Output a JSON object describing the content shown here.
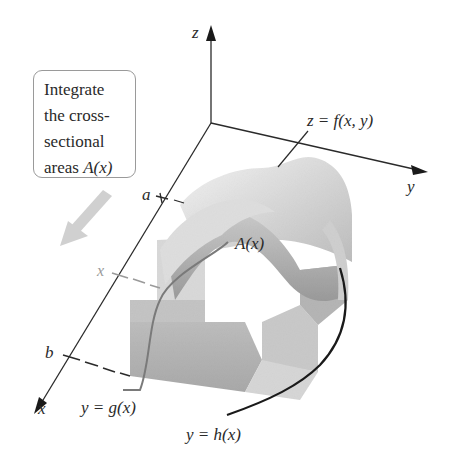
{
  "diagram": {
    "callout": {
      "lines": [
        "Integrate",
        "the cross-",
        "sectional",
        "areas "
      ],
      "last_line_math": "A(x)"
    },
    "axes": {
      "x_label": "x",
      "y_label": "y",
      "z_label": "z"
    },
    "ticks": {
      "a_label": "a",
      "x_label": "x",
      "b_label": "b"
    },
    "surface_label": "z = f(x, y)",
    "cross_section_label": "A(x)",
    "lower_curve_label": "y = g(x)",
    "upper_curve_label": "y = h(x)",
    "colors": {
      "axis": "#2a2a2a",
      "surface_light": "#e6e6e6",
      "surface_mid": "#c4c4c4",
      "surface_dark": "#9e9e9e",
      "arrow": "#cfcfcf",
      "dashes": "#555555",
      "tick_x_dash": "#9a9a9a"
    }
  }
}
